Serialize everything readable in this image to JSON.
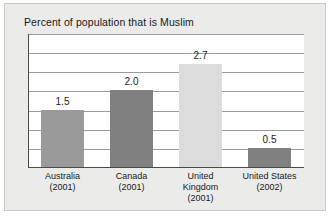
{
  "chart_data": {
    "type": "bar",
    "title": "Percent of population that is Muslim",
    "xlabel": "",
    "ylabel": "",
    "ylim": [
      0,
      3.5
    ],
    "grid": true,
    "gridline_values": [
      0.5,
      1.0,
      1.5,
      2.0,
      2.5,
      3.0,
      3.5
    ],
    "legend": "none",
    "categories": [
      "Australia (2001)",
      "Canada (2001)",
      "United Kingdom (2001)",
      "United States (2002)"
    ],
    "category_lines": [
      [
        "Australia",
        "(2001)"
      ],
      [
        "Canada",
        "(2001)"
      ],
      [
        "United",
        "Kingdom",
        "(2001)"
      ],
      [
        "United States",
        "(2002)"
      ]
    ],
    "values": [
      1.5,
      2.0,
      2.7,
      0.5
    ],
    "value_labels": [
      "1.5",
      "2.0",
      "2.7",
      "0.5"
    ],
    "bar_colors": [
      "#9a9a9a",
      "#808080",
      "#dcdcdc",
      "#808080"
    ]
  },
  "figure": {
    "background_color": "#ebebea",
    "border_color": "#c9c9c7",
    "plot_background_color": "#ffffff",
    "gridline_color": "#9b9b9b",
    "axis_color": "#4a4a4a",
    "text_color": "#1a1a1a"
  }
}
